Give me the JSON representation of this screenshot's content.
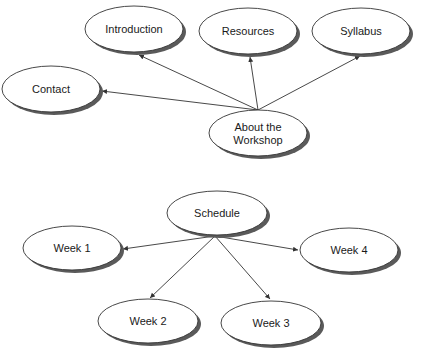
{
  "diagrams": [
    {
      "id": "about",
      "nodes": [
        {
          "key": "introduction",
          "label": "Introduction",
          "cx": 134,
          "cy": 29,
          "rx": 49,
          "ry": 23
        },
        {
          "key": "resources",
          "label": "Resources",
          "cx": 248,
          "cy": 31,
          "rx": 49,
          "ry": 23
        },
        {
          "key": "syllabus",
          "label": "Syllabus",
          "cx": 361,
          "cy": 31,
          "rx": 49,
          "ry": 23
        },
        {
          "key": "contact",
          "label": "Contact",
          "cx": 51,
          "cy": 89,
          "rx": 49,
          "ry": 23
        },
        {
          "key": "about",
          "label_lines": [
            "About the",
            "Workshop"
          ],
          "cx": 258,
          "cy": 133,
          "rx": 49,
          "ry": 23
        }
      ],
      "edges": [
        {
          "from": "about",
          "to": "introduction",
          "x1": 258,
          "y1": 110,
          "x2": 139,
          "y2": 55
        },
        {
          "from": "about",
          "to": "resources",
          "x1": 258,
          "y1": 110,
          "x2": 250,
          "y2": 57
        },
        {
          "from": "about",
          "to": "syllabus",
          "x1": 258,
          "y1": 110,
          "x2": 360,
          "y2": 56
        },
        {
          "from": "about",
          "to": "contact",
          "x1": 258,
          "y1": 110,
          "x2": 102,
          "y2": 91
        }
      ]
    },
    {
      "id": "schedule",
      "nodes": [
        {
          "key": "schedule",
          "label": "Schedule",
          "cx": 217,
          "cy": 213,
          "rx": 50,
          "ry": 22
        },
        {
          "key": "week1",
          "label": "Week 1",
          "cx": 72,
          "cy": 248,
          "rx": 49,
          "ry": 22
        },
        {
          "key": "week4",
          "label": "Week 4",
          "cx": 349,
          "cy": 250,
          "rx": 49,
          "ry": 22
        },
        {
          "key": "week2",
          "label": "Week 2",
          "cx": 148,
          "cy": 321,
          "rx": 50,
          "ry": 22
        },
        {
          "key": "week3",
          "label": "Week 3",
          "cx": 271,
          "cy": 323,
          "rx": 50,
          "ry": 22
        }
      ],
      "edges": [
        {
          "from": "schedule",
          "to": "week1",
          "x1": 215,
          "y1": 236,
          "x2": 123,
          "y2": 249
        },
        {
          "from": "schedule",
          "to": "week4",
          "x1": 215,
          "y1": 236,
          "x2": 298,
          "y2": 250
        },
        {
          "from": "schedule",
          "to": "week2",
          "x1": 215,
          "y1": 236,
          "x2": 150,
          "y2": 298
        },
        {
          "from": "schedule",
          "to": "week3",
          "x1": 215,
          "y1": 236,
          "x2": 270,
          "y2": 299
        }
      ]
    }
  ],
  "colors": {
    "node_fill": "#ffffff",
    "node_stroke": "#333333",
    "shadow": "#5a5a5a",
    "edge": "#333333",
    "text": "#1a1a1a"
  }
}
